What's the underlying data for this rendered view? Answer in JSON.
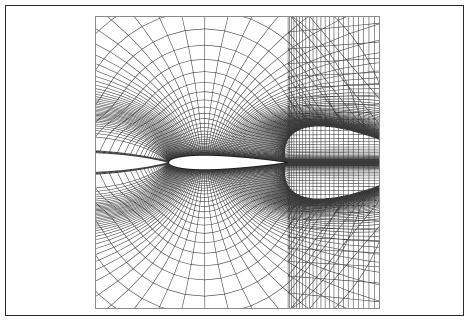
{
  "figure": {
    "domain_label": "computational-mesh",
    "background_color": "#ffffff",
    "frame": {
      "border_color": "#2b2b2b",
      "border_width_px": 1,
      "x": 5,
      "y": 5,
      "width": 459,
      "height": 311
    },
    "plot_box": {
      "border_color": "#8a8a8a",
      "border_width_px": 1,
      "x": 89,
      "y": 10,
      "width": 285,
      "height": 293
    }
  },
  "chart_data": {
    "type": "mesh",
    "title": "",
    "subtitle": "",
    "xlabel": "",
    "ylabel": "",
    "legend": [],
    "annotations": [],
    "grid": true,
    "grid_kind": "C-grid",
    "line_color": "#3a3a3a",
    "line_width_px": 0.55,
    "body_fill_color": "#ffffff",
    "body_outline_color": "#1a1a1a",
    "body_outline_width_px": 0.9,
    "axis_ranges": {
      "x": [
        -0.62,
        1.78
      ],
      "y": [
        -1.22,
        1.22
      ]
    },
    "airfoil": {
      "name": "symmetric-airfoil",
      "thickness_ratio": 0.12,
      "chord": 1.0,
      "leading_edge_xy": [
        0.0,
        0.0
      ],
      "trailing_edge_xy": [
        1.0,
        0.0
      ],
      "leading_edge_px": [
        118,
        240
      ],
      "trailing_edge_px": [
        275,
        240
      ],
      "max_thickness_px": 17
    },
    "topology": {
      "radial_lines": 121,
      "circumferential_lines": 41,
      "wake_lines": 24,
      "wake_start_x": 1.0,
      "wake_end_x": 1.78,
      "far_field_radius": 1.55,
      "first_cell_height": 0.0016,
      "radial_stretch_ratio": 1.155,
      "clustering": "leading-edge and wall clustered"
    },
    "features": [
      "dense boundary-layer clustering at airfoil surface",
      "radial rays fan out from leading edge",
      "wake cut downstream of trailing edge",
      "grid truncated by rectangular outer window",
      "top-bottom symmetric about the chord line"
    ]
  }
}
